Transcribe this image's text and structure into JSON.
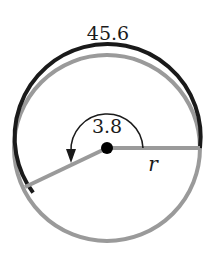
{
  "diagram": {
    "type": "circle-arc-length",
    "arc_length_label": "45.6",
    "angle_label": "3.8",
    "radius_label": "r",
    "center": [
      107,
      148
    ],
    "radius_px": 93,
    "angle_radians": 3.8,
    "colors": {
      "arc_highlight": "#1a1a1a",
      "arc_rest": "#9a9a9a",
      "radius_lines": "#9a9a9a",
      "center_dot": "#000000",
      "angle_marker": "#1a1a1a"
    }
  }
}
